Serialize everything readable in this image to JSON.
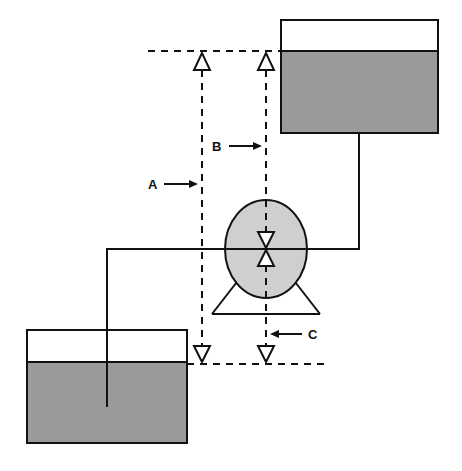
{
  "diagram": {
    "type": "pump head diagram",
    "labels": {
      "a": "A",
      "b": "B",
      "c": "C"
    },
    "elements": {
      "upper_tank": "Upper tank (discharge reservoir)",
      "lower_tank": "Lower tank (suction reservoir)",
      "pump": "Pump with centerline symbol",
      "level_markers": [
        "top water level marker",
        "bottom water level marker",
        "pump centerline marker"
      ]
    },
    "colors": {
      "liquid": "#9a9a9a",
      "pump_fill": "#cfcfcf",
      "line": "#111111",
      "background": "#ffffff"
    }
  }
}
